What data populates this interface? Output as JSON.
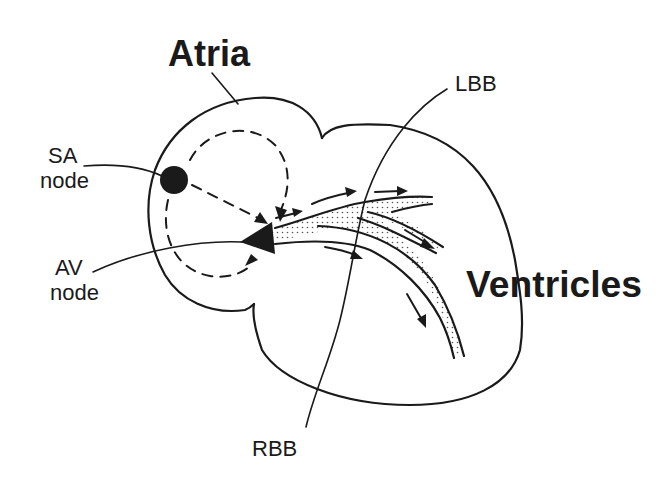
{
  "diagram": {
    "type": "cardiac-conduction-system",
    "labels": {
      "atria": "Atria",
      "ventricles": "Ventricles",
      "sa_node_line1": "SA",
      "sa_node_line2": "node",
      "av_node_line1": "AV",
      "av_node_line2": "node",
      "lbb": "LBB",
      "rbb": "RBB"
    },
    "nodes": [
      {
        "id": "sa-node",
        "name": "SA node",
        "shape": "circle"
      },
      {
        "id": "av-node",
        "name": "AV node",
        "shape": "triangle"
      },
      {
        "id": "lbb",
        "name": "LBB",
        "shape": "bundle"
      },
      {
        "id": "rbb",
        "name": "RBB",
        "shape": "bundle"
      }
    ],
    "edges": [
      {
        "from": "sa-node",
        "to": "av-node",
        "style": "dashed",
        "path": "direct"
      },
      {
        "from": "sa-node",
        "to": "av-node",
        "style": "dashed",
        "path": "over-top"
      },
      {
        "from": "sa-node",
        "to": "av-node",
        "style": "dashed",
        "path": "under-bottom"
      },
      {
        "from": "av-node",
        "to": "lbb",
        "style": "solid-arrows"
      },
      {
        "from": "av-node",
        "to": "rbb",
        "style": "solid-arrows"
      }
    ],
    "colors": {
      "ink": "#1a1a1a",
      "background": "#ffffff"
    }
  }
}
